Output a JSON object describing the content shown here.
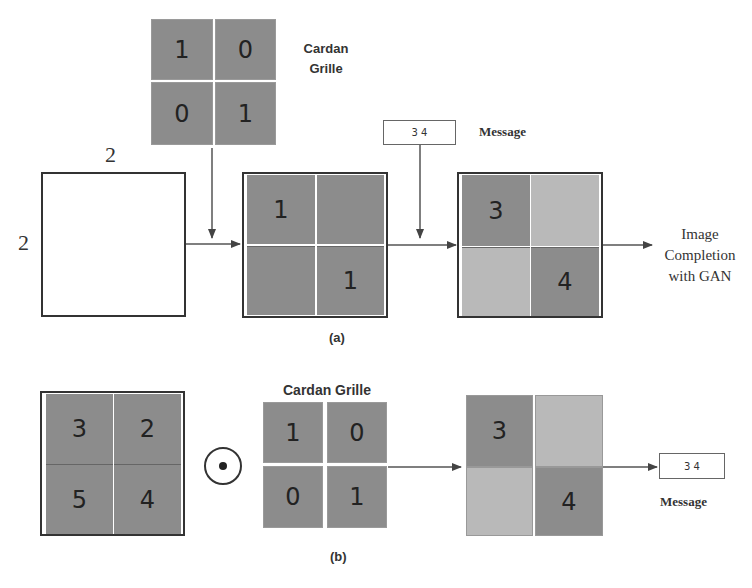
{
  "panel_a": {
    "caption": "(a)",
    "cardan_grille": {
      "label_line1": "Cardan",
      "label_line2": "Grille",
      "cells": [
        "1",
        "0",
        "0",
        "1"
      ]
    },
    "empty_image": {
      "width_label": "2",
      "height_label": "2"
    },
    "masked_grid": {
      "cells": [
        "1",
        "",
        "",
        "1"
      ]
    },
    "message": {
      "value": "3 4",
      "label": "Message"
    },
    "stego_grid": {
      "cells": [
        "3",
        "",
        "",
        "4"
      ]
    },
    "output_label": {
      "line1": "Image",
      "line2": "Completion",
      "line3": "with GAN"
    }
  },
  "panel_b": {
    "caption": "(b)",
    "input_grid": {
      "cells": [
        "3",
        "2",
        "5",
        "4"
      ]
    },
    "operator_icon": "circled-dot-operator",
    "cardan_grille": {
      "label": "Cardan Grille",
      "cells": [
        "1",
        "0",
        "0",
        "1"
      ]
    },
    "extracted_grid": {
      "cells": [
        "3",
        "",
        "",
        "4"
      ]
    },
    "message": {
      "value": "3 4",
      "label": "Message"
    }
  },
  "colors": {
    "dark_cell": "#8c8c8c",
    "light_cell": "#b9b9b9",
    "line": "#444444",
    "frame": "#333333"
  }
}
